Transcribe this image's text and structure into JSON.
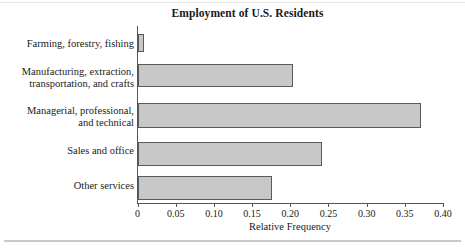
{
  "chart_data": {
    "type": "bar",
    "orientation": "horizontal",
    "title": "Employment of U.S. Residents",
    "xlabel": "Relative Frequency",
    "ylabel": "",
    "xlim": [
      0,
      0.4
    ],
    "xticks": [
      "0",
      "0.05",
      "0.10",
      "0.15",
      "0.20",
      "0.25",
      "0.30",
      "0.35",
      "0.40"
    ],
    "xtick_values": [
      0,
      0.05,
      0.1,
      0.15,
      0.2,
      0.25,
      0.3,
      0.35,
      0.4
    ],
    "grid": false,
    "legend": null,
    "categories": [
      "Farming, forestry, fishing",
      "Manufacturing, extraction,\ntransportation, and crafts",
      "Managerial, professional,\nand technical",
      "Sales and office",
      "Other services"
    ],
    "values": [
      0.008,
      0.203,
      0.371,
      0.241,
      0.176
    ],
    "bar_fill_color": "#c8c8c8",
    "bar_edge_color": "#5a5a5a",
    "axis_color": "#555555",
    "background_color": "#ffffff"
  }
}
